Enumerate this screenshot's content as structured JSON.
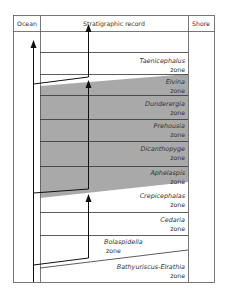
{
  "header": {
    "ocean": "Ocean",
    "record": "Stratigraphic record",
    "shore": "Shore"
  },
  "zones": [
    {
      "name": "Taenicephalus",
      "suffix": "zone",
      "shaded": false
    },
    {
      "name": "Elvina",
      "suffix": "zone",
      "shaded": true
    },
    {
      "name": "Dunderergia",
      "suffix": "zone",
      "shaded": true
    },
    {
      "name": "Prehousia",
      "suffix": "zone",
      "shaded": true
    },
    {
      "name": "Dicanthopyge",
      "suffix": "zone",
      "shaded": true
    },
    {
      "name": "Aphelaspis",
      "suffix": "zone",
      "shaded": true
    },
    {
      "name": "Crepicephalas",
      "suffix": "zone",
      "shaded": false
    },
    {
      "name": "Cedaria",
      "suffix": "zone",
      "shaded": false
    },
    {
      "name": "Bolaspidella",
      "suffix": "zone",
      "shaded": false
    },
    {
      "name": "Bathyuriscus-Elrathia",
      "suffix": "zone",
      "shaded": false
    }
  ],
  "colors": {
    "shading": "#a9a9a9",
    "lines": "#222222",
    "frame": "#555555"
  }
}
